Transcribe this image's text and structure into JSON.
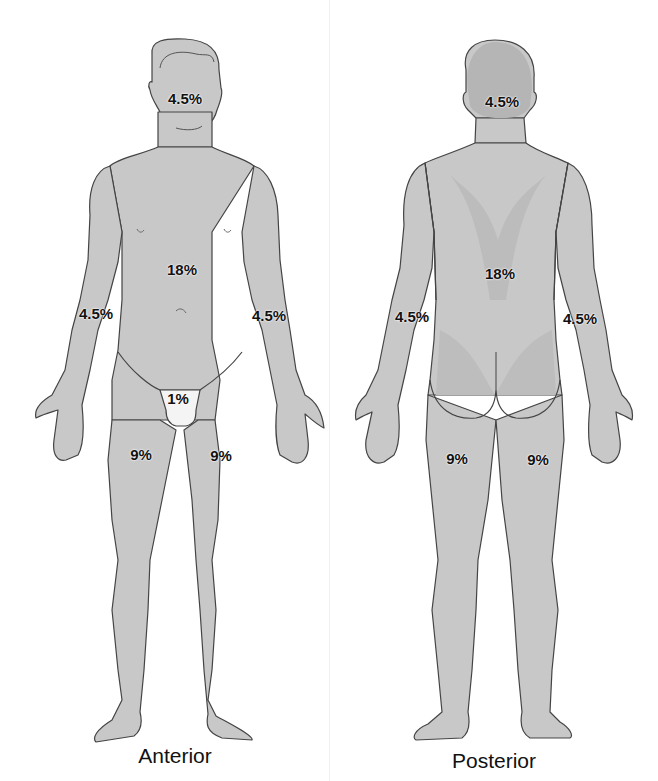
{
  "diagram": {
    "colors": {
      "body_fill": "#c8c8c8",
      "body_fill_light": "#d3d3d3",
      "body_fill_dark": "#b8b8b8",
      "outline": "#444444",
      "perineum_fill": "#f4f4f4",
      "text": "#111111",
      "background": "#ffffff"
    },
    "anterior": {
      "label": "Anterior",
      "regions": {
        "head": "4.5%",
        "trunk": "18%",
        "right_arm": "4.5%",
        "left_arm": "4.5%",
        "perineum": "1%",
        "right_leg": "9%",
        "left_leg": "9%"
      }
    },
    "posterior": {
      "label": "Posterior",
      "regions": {
        "head": "4.5%",
        "trunk": "18%",
        "left_arm": "4.5%",
        "right_arm": "4.5%",
        "left_leg": "9%",
        "right_leg": "9%"
      }
    }
  }
}
